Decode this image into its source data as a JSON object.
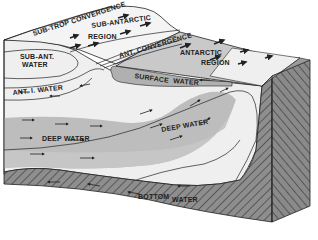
{
  "diagram": {
    "type": "block-diagram",
    "surface_labels": [
      {
        "id": "sub-trop-convergence",
        "text": "SUB-TROP CONVERGENCE"
      },
      {
        "id": "sub-antarctic-region-1",
        "text": "SUB-ANTARCTIC"
      },
      {
        "id": "sub-antarctic-region-2",
        "text": "REGION"
      },
      {
        "id": "ant-convergence",
        "text": "ANT. CONVERGENCE"
      },
      {
        "id": "antarctic-region-1",
        "text": "ANTARCTIC"
      },
      {
        "id": "antarctic-region-2",
        "text": "REGION"
      }
    ],
    "section_labels": [
      {
        "id": "sub-ant-water-1",
        "text": "SUB-ANT."
      },
      {
        "id": "sub-ant-water-2",
        "text": "WATER"
      },
      {
        "id": "surface-water-1",
        "text": "SURFACE"
      },
      {
        "id": "surface-water-2",
        "text": "WATER"
      },
      {
        "id": "ant-i-water",
        "text": "ANT. I. WATER"
      },
      {
        "id": "deep-water-left",
        "text": "DEEP   WATER"
      },
      {
        "id": "deep-water-right",
        "text": "DEEP WATER"
      },
      {
        "id": "bottom-water-1",
        "text": "BOTTOM"
      },
      {
        "id": "bottom-water-2",
        "text": "WATER"
      }
    ],
    "colors": {
      "background": "#ffffff",
      "light_water": "#efefef",
      "surface_top": "#f4f4f4",
      "antarctic_surface": "#c9c9c9",
      "deep_water": "#bdbdbd",
      "surface_water_tongue": "#b0b0b0",
      "seafloor": "#8a8a8a",
      "line": "#222222"
    }
  }
}
